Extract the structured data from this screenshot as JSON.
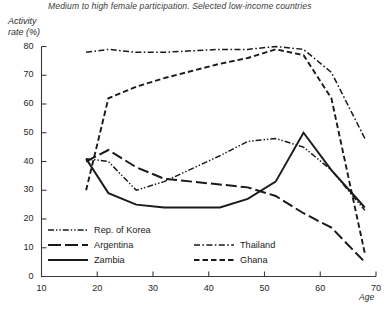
{
  "chart_data": {
    "type": "line",
    "title": "Medium to high female participation. Selected low-income countries",
    "xlabel": "Age",
    "ylabel": "Activity rate (%)",
    "xlim": [
      10,
      70
    ],
    "ylim": [
      0,
      80
    ],
    "xticks": [
      10,
      20,
      30,
      40,
      50,
      60,
      70
    ],
    "yticks": [
      0,
      10,
      20,
      30,
      40,
      50,
      60,
      70,
      80
    ],
    "grid": false,
    "legend_position": "inside-lower-left",
    "series": [
      {
        "name": "Rep. of Korea",
        "style": "dash-dot-dot",
        "x": [
          18,
          22,
          27,
          32,
          42,
          47,
          52,
          57,
          62,
          68
        ],
        "y": [
          41,
          40,
          30,
          33,
          42,
          47,
          48,
          45,
          37,
          23
        ]
      },
      {
        "name": "Argentina",
        "style": "long-dash",
        "x": [
          18,
          22,
          27,
          32,
          42,
          47,
          52,
          57,
          62,
          68
        ],
        "y": [
          40,
          44,
          38,
          34,
          32,
          31,
          28,
          22,
          17,
          5
        ]
      },
      {
        "name": "Zambia",
        "style": "solid",
        "x": [
          18,
          22,
          27,
          32,
          42,
          47,
          52,
          57,
          62,
          68
        ],
        "y": [
          41,
          29,
          25,
          24,
          24,
          27,
          33,
          50,
          37,
          24
        ]
      },
      {
        "name": "Thailand",
        "style": "dash-dot",
        "x": [
          18,
          22,
          27,
          32,
          42,
          47,
          52,
          57,
          62,
          68
        ],
        "y": [
          78,
          79,
          78,
          78,
          79,
          79,
          80,
          79,
          71,
          48
        ]
      },
      {
        "name": "Ghana",
        "style": "short-dash",
        "x": [
          18,
          22,
          27,
          32,
          42,
          47,
          52,
          57,
          62,
          68
        ],
        "y": [
          30,
          62,
          66,
          69,
          74,
          76,
          79,
          77,
          62,
          8
        ]
      }
    ]
  },
  "legend": {
    "left_column": [
      "Rep. of Korea",
      "Argentina",
      "Zambia"
    ],
    "right_column": [
      "Thailand",
      "Ghana"
    ]
  },
  "colors": {
    "ink": "#1a1a1a",
    "axis": "#3a3a3a",
    "background": "#ffffff"
  }
}
